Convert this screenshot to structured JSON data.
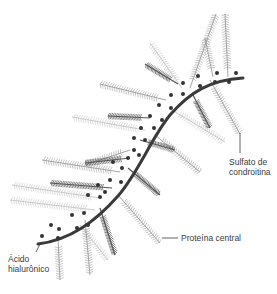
{
  "labels": {
    "chondroitin": [
      "Sulfato de",
      "condroitina"
    ],
    "hyaluronic": [
      "Ácido",
      "hialurônico"
    ],
    "core_protein": "Proteína central"
  },
  "colors": {
    "backbone": "#3a3a3a",
    "dark_chain": "#555555",
    "mid_chain": "#9a9a9a",
    "light_chain": "#c4c4c4",
    "dot": "#333333",
    "label": "#3a3a3a"
  },
  "backbone_path": "M38,244 C70,240 95,222 118,196 C140,170 150,140 170,115 C190,92 210,80 243,78",
  "core_proteins": [
    {
      "x1": 190,
      "y1": 88,
      "x2": 216,
      "y2": 14,
      "shade": "mid"
    },
    {
      "x1": 213,
      "y1": 77,
      "x2": 205,
      "y2": 38,
      "shade": "mid"
    },
    {
      "x1": 228,
      "y1": 77,
      "x2": 225,
      "y2": 14,
      "shade": "mid"
    },
    {
      "x1": 182,
      "y1": 88,
      "x2": 150,
      "y2": 43,
      "shade": "light"
    },
    {
      "x1": 178,
      "y1": 84,
      "x2": 145,
      "y2": 64,
      "shade": "dark"
    },
    {
      "x1": 192,
      "y1": 93,
      "x2": 210,
      "y2": 128,
      "shade": "dark"
    },
    {
      "x1": 210,
      "y1": 80,
      "x2": 240,
      "y2": 134,
      "shade": "mid"
    },
    {
      "x1": 166,
      "y1": 100,
      "x2": 100,
      "y2": 84,
      "shade": "mid"
    },
    {
      "x1": 172,
      "y1": 110,
      "x2": 225,
      "y2": 142,
      "shade": "light"
    },
    {
      "x1": 150,
      "y1": 118,
      "x2": 108,
      "y2": 116,
      "shade": "dark"
    },
    {
      "x1": 145,
      "y1": 130,
      "x2": 72,
      "y2": 117,
      "shade": "light"
    },
    {
      "x1": 155,
      "y1": 135,
      "x2": 200,
      "y2": 172,
      "shade": "mid"
    },
    {
      "x1": 140,
      "y1": 140,
      "x2": 175,
      "y2": 150,
      "shade": "dark"
    },
    {
      "x1": 130,
      "y1": 150,
      "x2": 85,
      "y2": 165,
      "shade": "mid"
    },
    {
      "x1": 130,
      "y1": 158,
      "x2": 85,
      "y2": 163,
      "shade": "dark"
    },
    {
      "x1": 128,
      "y1": 168,
      "x2": 160,
      "y2": 195,
      "shade": "dark"
    },
    {
      "x1": 120,
      "y1": 172,
      "x2": 42,
      "y2": 160,
      "shade": "mid"
    },
    {
      "x1": 112,
      "y1": 188,
      "x2": 50,
      "y2": 183,
      "shade": "dark"
    },
    {
      "x1": 118,
      "y1": 195,
      "x2": 160,
      "y2": 243,
      "shade": "mid"
    },
    {
      "x1": 100,
      "y1": 198,
      "x2": 12,
      "y2": 185,
      "shade": "light"
    },
    {
      "x1": 95,
      "y1": 210,
      "x2": 10,
      "y2": 200,
      "shade": "light"
    },
    {
      "x1": 100,
      "y1": 208,
      "x2": 115,
      "y2": 255,
      "shade": "dark"
    },
    {
      "x1": 85,
      "y1": 220,
      "x2": 90,
      "y2": 275,
      "shade": "mid"
    },
    {
      "x1": 80,
      "y1": 225,
      "x2": 108,
      "y2": 260,
      "shade": "light"
    },
    {
      "x1": 58,
      "y1": 238,
      "x2": 60,
      "y2": 280,
      "shade": "mid"
    }
  ],
  "link_dots": [
    [
      198,
      76
    ],
    [
      217,
      73
    ],
    [
      236,
      73
    ],
    [
      200,
      86
    ],
    [
      215,
      82
    ],
    [
      229,
      82
    ],
    [
      183,
      83
    ],
    [
      171,
      95
    ],
    [
      183,
      94
    ],
    [
      159,
      105
    ],
    [
      171,
      108
    ],
    [
      150,
      116
    ],
    [
      162,
      120
    ],
    [
      141,
      128
    ],
    [
      154,
      128
    ],
    [
      134,
      138
    ],
    [
      145,
      140
    ],
    [
      134,
      150
    ],
    [
      128,
      158
    ],
    [
      139,
      155
    ],
    [
      122,
      168
    ],
    [
      113,
      162
    ],
    [
      110,
      180
    ],
    [
      121,
      182
    ],
    [
      98,
      185
    ],
    [
      105,
      192
    ],
    [
      88,
      195
    ],
    [
      100,
      197
    ],
    [
      84,
      213
    ],
    [
      72,
      215
    ],
    [
      77,
      228
    ],
    [
      88,
      225
    ],
    [
      51,
      225
    ],
    [
      59,
      229
    ],
    [
      58,
      238
    ],
    [
      42,
      236
    ]
  ]
}
